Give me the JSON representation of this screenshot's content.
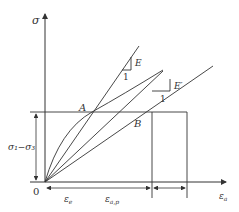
{
  "diagram": {
    "title": "",
    "axes": {
      "y_label": "σ",
      "x_label": "ε",
      "x_label_sub": "a",
      "origin_label": "0"
    },
    "points": {
      "A": "A",
      "B": "B"
    },
    "slopes": {
      "E_label": "E",
      "E_run": "1",
      "E_prime_label": "E′",
      "E_prime_run": "1"
    },
    "dimensions": {
      "stress_label": "σ₁−σ₃",
      "strain_e_label": "ε",
      "strain_e_sub": "e",
      "strain_ep_label": "ε",
      "strain_ep_sub": "a,p"
    },
    "colors": {
      "line": "#333333",
      "background": "#ffffff"
    }
  }
}
